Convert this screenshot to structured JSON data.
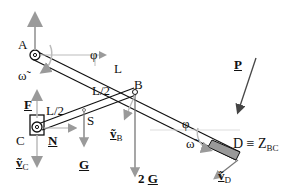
{
  "diagram": {
    "labels": {
      "A": "A",
      "B": "B",
      "C": "C",
      "D": "D ≡ Z",
      "D_sub": "BC",
      "S": "S",
      "L": "L",
      "L_half_top": "L/2",
      "L_half_left": "L/2",
      "phi_A": "φ",
      "phi_D": "φ",
      "omega_A": "ω̃",
      "omega_D": "ω̃",
      "F": "F",
      "N": "N",
      "G": "G",
      "twoG_num": "2 ",
      "twoG": "G",
      "P": "P",
      "vB": "ṽ",
      "vB_sub": "B",
      "vC": "ṽ",
      "vC_sub": "C",
      "vD": "ṽ",
      "vD_sub": "D"
    },
    "colors": {
      "line": "#111111",
      "arrow_gray": "#9a9a9a",
      "slider_fill": "#999999"
    }
  }
}
